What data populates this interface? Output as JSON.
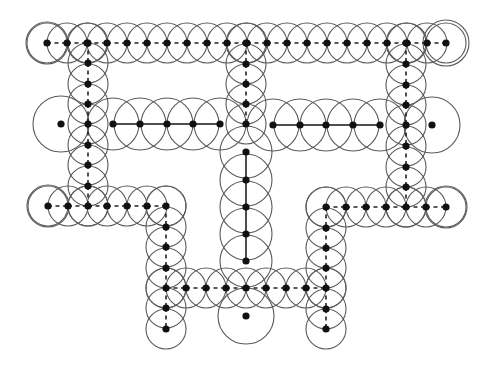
{
  "diagram": {
    "width": 487,
    "height": 365,
    "colors": {
      "circle": "#5a5a5a",
      "node": "#111111",
      "edge": "#222222",
      "background": "#ffffff"
    },
    "paths": [
      {
        "id": "top-row",
        "style": "dashed",
        "radius": 20,
        "points": [
          [
            47,
            43
          ],
          [
            67,
            43
          ],
          [
            87,
            43
          ],
          [
            107,
            43
          ],
          [
            127,
            43
          ],
          [
            147,
            43
          ],
          [
            167,
            43
          ],
          [
            187,
            43
          ],
          [
            207,
            43
          ],
          [
            227,
            43
          ],
          [
            247,
            43
          ],
          [
            267,
            43
          ],
          [
            287,
            43
          ],
          [
            307,
            43
          ],
          [
            327,
            43
          ],
          [
            347,
            43
          ],
          [
            367,
            43
          ],
          [
            387,
            43
          ],
          [
            407,
            43
          ],
          [
            427,
            43
          ],
          [
            446,
            43
          ]
        ]
      },
      {
        "id": "left-column",
        "style": "dashed",
        "radius": 20,
        "points": [
          [
            88,
            43
          ],
          [
            88,
            63
          ],
          [
            88,
            84
          ],
          [
            88,
            104
          ],
          [
            88,
            124
          ],
          [
            88,
            145
          ],
          [
            88,
            165
          ],
          [
            88,
            186
          ],
          [
            88,
            206
          ]
        ]
      },
      {
        "id": "center-upper-column",
        "style": "dashed",
        "radius": 20,
        "points": [
          [
            246,
            43
          ],
          [
            246,
            64
          ],
          [
            246,
            84
          ],
          [
            246,
            104
          ],
          [
            246,
            124
          ]
        ]
      },
      {
        "id": "right-column",
        "style": "dashed",
        "radius": 20,
        "points": [
          [
            406,
            43
          ],
          [
            406,
            64
          ],
          [
            406,
            85
          ],
          [
            406,
            105
          ],
          [
            406,
            125
          ],
          [
            406,
            146
          ],
          [
            406,
            167
          ],
          [
            406,
            187
          ],
          [
            406,
            207
          ]
        ]
      },
      {
        "id": "middle-left-row",
        "style": "solid",
        "radius": 26,
        "points": [
          [
            113,
            124
          ],
          [
            140,
            124
          ],
          [
            167,
            124
          ],
          [
            193,
            124
          ],
          [
            220,
            124
          ]
        ]
      },
      {
        "id": "middle-right-row",
        "style": "solid",
        "radius": 26,
        "points": [
          [
            273,
            125
          ],
          [
            300,
            125
          ],
          [
            326,
            125
          ],
          [
            353,
            125
          ],
          [
            380,
            125
          ]
        ]
      },
      {
        "id": "center-lower-column",
        "style": "solid",
        "radius": 26,
        "points": [
          [
            246,
            152
          ],
          [
            246,
            180
          ],
          [
            246,
            207
          ],
          [
            246,
            234
          ],
          [
            246,
            261
          ]
        ]
      },
      {
        "id": "bottom-left-row",
        "style": "dashed",
        "radius": 20,
        "points": [
          [
            48,
            206
          ],
          [
            68,
            206
          ],
          [
            88,
            206
          ],
          [
            107,
            206
          ],
          [
            127,
            206
          ],
          [
            147,
            206
          ],
          [
            166,
            206
          ]
        ]
      },
      {
        "id": "left-lower-column",
        "style": "dashed",
        "radius": 20,
        "points": [
          [
            166,
            206
          ],
          [
            166,
            227
          ],
          [
            166,
            247
          ],
          [
            166,
            268
          ],
          [
            166,
            288
          ],
          [
            166,
            308
          ],
          [
            166,
            329
          ]
        ]
      },
      {
        "id": "bottom-row",
        "style": "dashed",
        "radius": 20,
        "points": [
          [
            166,
            288
          ],
          [
            186,
            288
          ],
          [
            206,
            288
          ],
          [
            226,
            288
          ],
          [
            246,
            288
          ],
          [
            266,
            288
          ],
          [
            286,
            288
          ],
          [
            306,
            288
          ],
          [
            326,
            288
          ]
        ]
      },
      {
        "id": "right-lower-column",
        "style": "dashed",
        "radius": 20,
        "points": [
          [
            326,
            207
          ],
          [
            326,
            228
          ],
          [
            326,
            248
          ],
          [
            326,
            268
          ],
          [
            326,
            288
          ],
          [
            326,
            309
          ],
          [
            326,
            329
          ]
        ]
      },
      {
        "id": "bottom-right-row",
        "style": "dashed",
        "radius": 20,
        "points": [
          [
            326,
            207
          ],
          [
            346,
            207
          ],
          [
            366,
            207
          ],
          [
            386,
            207
          ],
          [
            406,
            207
          ],
          [
            426,
            207
          ],
          [
            446,
            207
          ]
        ]
      }
    ],
    "isolated_nodes": [
      {
        "id": "left-isolated",
        "x": 61,
        "y": 124,
        "radius": 28
      },
      {
        "id": "right-isolated",
        "x": 432,
        "y": 125,
        "radius": 28
      },
      {
        "id": "bottom-isolated",
        "x": 246,
        "y": 316,
        "radius": 28
      }
    ],
    "end_circles": [
      {
        "x": 47,
        "y": 43,
        "radius": 21
      },
      {
        "x": 446,
        "y": 43,
        "radius": 23
      },
      {
        "x": 48,
        "y": 206,
        "radius": 21
      },
      {
        "x": 446,
        "y": 207,
        "radius": 21
      }
    ]
  }
}
